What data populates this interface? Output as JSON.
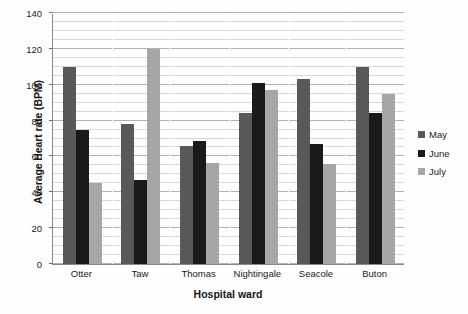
{
  "chart_data": {
    "type": "bar",
    "title": "",
    "xlabel": "Hospital ward",
    "ylabel": "Average Heart rate (BPM)",
    "categories": [
      "Otter",
      "Taw",
      "Thomas",
      "Nightingale",
      "Seacole",
      "Buton"
    ],
    "series": [
      {
        "name": "May",
        "color": "#595959",
        "values": [
          110,
          78,
          66,
          84,
          103,
          110
        ]
      },
      {
        "name": "June",
        "color": "#1a1a1a",
        "values": [
          75,
          47,
          68.5,
          101,
          67,
          84
        ]
      },
      {
        "name": "July",
        "color": "#a6a6a6",
        "values": [
          45,
          120,
          56.5,
          97,
          56,
          95
        ]
      }
    ],
    "ylim": [
      0,
      140
    ],
    "y_major_step": 20,
    "y_minor_step": 5,
    "y_tick_labels": [
      "0",
      "20",
      "40",
      "60",
      "80",
      "100",
      "120",
      "140"
    ],
    "grid": true,
    "legend_position": "right"
  },
  "legend": {
    "items": [
      {
        "label": "May"
      },
      {
        "label": "June"
      },
      {
        "label": "July"
      }
    ]
  }
}
